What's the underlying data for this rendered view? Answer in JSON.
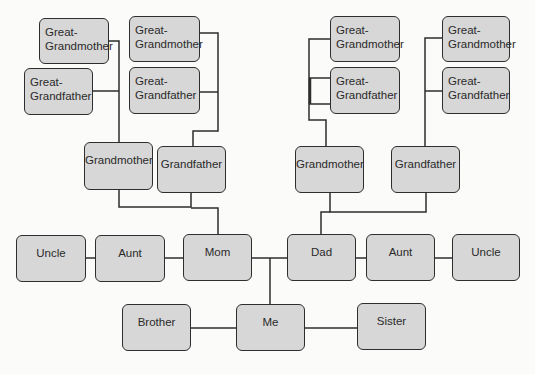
{
  "diagram": {
    "style": {
      "box_fill": "#d7d7d7",
      "box_border": "#2e2e2e",
      "line_color": "#2e2e2e",
      "background": "#fbfbfa"
    },
    "generations": {
      "great_grandparents": [
        {
          "id": "ggm1",
          "label": "Great-\nGrandmother",
          "line1": "Great-",
          "line2": "Grandmother"
        },
        {
          "id": "ggf1",
          "label": "Great-\nGrandfather",
          "line1": "Great-",
          "line2": "Grandfather"
        },
        {
          "id": "ggm2",
          "label": "Great-\nGrandmother",
          "line1": "Great-",
          "line2": "Grandmother"
        },
        {
          "id": "ggf2",
          "label": "Great-\nGrandfather",
          "line1": "Great-",
          "line2": "Grandfather"
        },
        {
          "id": "ggm3",
          "label": "Great-\nGrandmother",
          "line1": "Great-",
          "line2": "Grandmother"
        },
        {
          "id": "ggf3",
          "label": "Great-\nGrandfather",
          "line1": "Great-",
          "line2": "Grandfather"
        },
        {
          "id": "ggm4",
          "label": "Great-\nGrandmother",
          "line1": "Great-",
          "line2": "Grandmother"
        },
        {
          "id": "ggf4",
          "label": "Great-\nGrandfather",
          "line1": "Great-",
          "line2": "Grandfather"
        }
      ],
      "grandparents": [
        {
          "id": "gm_maternal",
          "label": "Grandmother"
        },
        {
          "id": "gf_maternal",
          "label": "Grandfather"
        },
        {
          "id": "gm_paternal",
          "label": "Grandmother"
        },
        {
          "id": "gf_paternal",
          "label": "Grandfather"
        }
      ],
      "parents_row": [
        {
          "id": "uncle_maternal",
          "label": "Uncle"
        },
        {
          "id": "aunt_maternal",
          "label": "Aunt"
        },
        {
          "id": "mom",
          "label": "Mom"
        },
        {
          "id": "dad",
          "label": "Dad"
        },
        {
          "id": "aunt_paternal",
          "label": "Aunt"
        },
        {
          "id": "uncle_paternal",
          "label": "Uncle"
        }
      ],
      "children_row": [
        {
          "id": "brother",
          "label": "Brother"
        },
        {
          "id": "me",
          "label": "Me"
        },
        {
          "id": "sister",
          "label": "Sister"
        }
      ]
    }
  }
}
